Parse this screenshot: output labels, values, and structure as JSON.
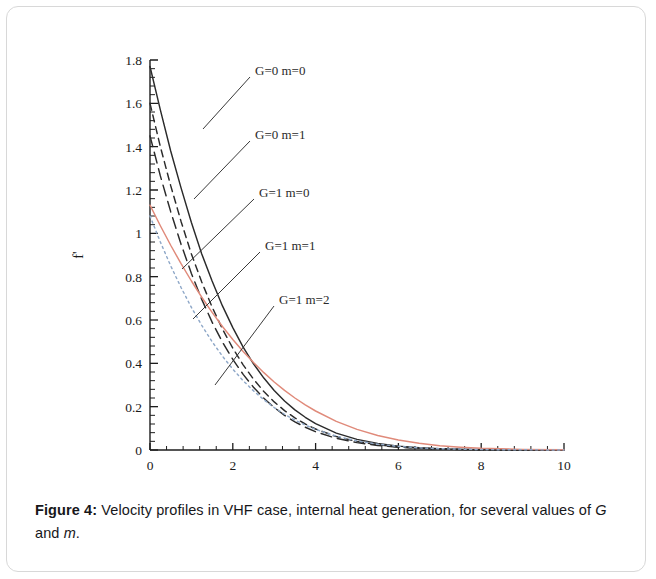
{
  "figure": {
    "caption_label": "Figure 4:",
    "caption_text": " Velocity profiles in VHF case, internal heat generation, for several values of ",
    "caption_sym_g": "G",
    "caption_and": " and ",
    "caption_sym_m": "m",
    "caption_end": "."
  },
  "chart_data": {
    "type": "line",
    "title": "",
    "xlabel": "η",
    "ylabel": "f'",
    "xlim": [
      0,
      10
    ],
    "ylim": [
      0,
      1.8
    ],
    "xticks": [
      0,
      2,
      4,
      6,
      8,
      10
    ],
    "xtick_labels": [
      "0",
      "2",
      "4",
      "6",
      "8",
      "10"
    ],
    "yticks": [
      0,
      0.2,
      0.4,
      0.6,
      0.8,
      1,
      1.2,
      1.4,
      1.6,
      1.8
    ],
    "ytick_labels": [
      "0",
      "0.2",
      "0.4",
      "0.6",
      "0.8",
      "1",
      "1.2",
      "1.4",
      "1.6",
      "1.8"
    ],
    "minor_tick_count": 5,
    "grid": false,
    "legend": "annotations-with-leader-lines",
    "x": [
      0,
      0.25,
      0.5,
      0.75,
      1,
      1.25,
      1.5,
      1.75,
      2,
      2.25,
      2.5,
      2.75,
      3,
      3.25,
      3.5,
      3.75,
      4,
      4.5,
      5,
      5.5,
      6,
      6.5,
      7,
      7.5,
      8,
      9,
      10
    ],
    "series": [
      {
        "name": "G=0 m=0",
        "label": "G=0 m=0",
        "color": "#2b2b2b",
        "dash": "solid",
        "label_x": 248,
        "label_y": 68,
        "leader": [
          [
            196,
            122
          ],
          [
            243,
            70
          ]
        ],
        "values": [
          1.77,
          1.57,
          1.38,
          1.21,
          1.05,
          0.905,
          0.78,
          0.665,
          0.565,
          0.475,
          0.398,
          0.332,
          0.275,
          0.226,
          0.185,
          0.151,
          0.122,
          0.078,
          0.049,
          0.03,
          0.018,
          0.01,
          0.006,
          0.003,
          0.002,
          0.0,
          0.0
        ]
      },
      {
        "name": "G=0 m=1",
        "label": "G=0 m=1",
        "color": "#2b2b2b",
        "dash": "dashed",
        "label_x": 248,
        "label_y": 132,
        "leader": [
          [
            187,
            192
          ],
          [
            243,
            134
          ]
        ],
        "values": [
          1.6,
          1.4,
          1.22,
          1.055,
          0.905,
          0.775,
          0.66,
          0.558,
          0.47,
          0.393,
          0.327,
          0.27,
          0.222,
          0.182,
          0.148,
          0.12,
          0.097,
          0.062,
          0.039,
          0.024,
          0.014,
          0.008,
          0.005,
          0.003,
          0.001,
          0.0,
          0.0
        ]
      },
      {
        "name": "G=1 m=0",
        "label": "G=1 m=0",
        "color": "#2b2b2b",
        "dash": "dashed-long",
        "label_x": 252,
        "label_y": 190,
        "leader": [
          [
            175,
            262
          ],
          [
            247,
            192
          ]
        ],
        "values": [
          1.45,
          1.265,
          1.1,
          0.95,
          0.815,
          0.695,
          0.59,
          0.498,
          0.418,
          0.349,
          0.29,
          0.239,
          0.196,
          0.16,
          0.13,
          0.105,
          0.084,
          0.054,
          0.034,
          0.021,
          0.013,
          0.008,
          0.004,
          0.002,
          0.001,
          0.0,
          0.0
        ]
      },
      {
        "name": "G=1 m=1",
        "label": "G=1 m=1",
        "color": "#e08a7a",
        "dash": "solid",
        "label_x": 258,
        "label_y": 243,
        "leader": [
          [
            186,
            312
          ],
          [
            253,
            245
          ]
        ],
        "values": [
          1.13,
          1.035,
          0.945,
          0.86,
          0.78,
          0.705,
          0.635,
          0.57,
          0.51,
          0.455,
          0.404,
          0.357,
          0.314,
          0.275,
          0.24,
          0.208,
          0.18,
          0.132,
          0.095,
          0.067,
          0.046,
          0.031,
          0.02,
          0.013,
          0.008,
          0.003,
          0.001
        ]
      },
      {
        "name": "G=1 m=2",
        "label": "G=1 m=2",
        "color": "#8fa8c8",
        "dash": "dotted",
        "label_x": 272,
        "label_y": 297,
        "leader": [
          [
            208,
            378
          ],
          [
            267,
            299
          ]
        ],
        "values": [
          1.08,
          0.96,
          0.85,
          0.75,
          0.658,
          0.575,
          0.5,
          0.433,
          0.373,
          0.32,
          0.273,
          0.232,
          0.196,
          0.165,
          0.138,
          0.115,
          0.095,
          0.064,
          0.042,
          0.027,
          0.017,
          0.01,
          0.006,
          0.004,
          0.002,
          0.001,
          0.0
        ]
      }
    ]
  }
}
